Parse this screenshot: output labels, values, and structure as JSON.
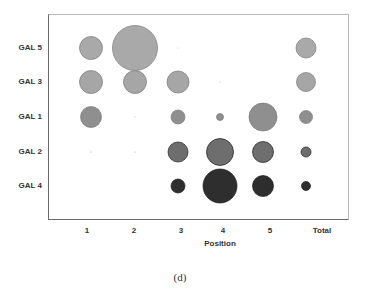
{
  "chart_data": {
    "type": "scatter",
    "subtype": "bubble",
    "title": "",
    "caption": "(d)",
    "xlabel": "Position",
    "ylabel": "",
    "categories_x": [
      "1",
      "2",
      "3",
      "4",
      "5",
      "Total"
    ],
    "categories_y": [
      "GAL 5",
      "GAL 3",
      "GAL 1",
      "GAL 2",
      "GAL 4"
    ],
    "grid": false,
    "legend": null,
    "series": [
      {
        "name": "GAL 5",
        "color": "#a9a9a9",
        "sizes": [
          23,
          45,
          1,
          0,
          0,
          20
        ]
      },
      {
        "name": "GAL 3",
        "color": "#a6a6a6",
        "sizes": [
          23,
          23,
          22,
          1,
          0,
          19
        ]
      },
      {
        "name": "GAL 1",
        "color": "#8f8f8f",
        "sizes": [
          21,
          1,
          14,
          7,
          28,
          13
        ]
      },
      {
        "name": "GAL 2",
        "color": "#6e6e6e",
        "sizes": [
          1,
          1,
          20,
          27,
          21,
          10
        ]
      },
      {
        "name": "GAL 4",
        "color": "#2e2e2e",
        "sizes": [
          0,
          0,
          14,
          34,
          21,
          9
        ]
      }
    ],
    "size_units": "bubble diameter in px (relative)"
  },
  "axes": {
    "x_ticks": [
      "1",
      "2",
      "3",
      "4",
      "5",
      "Total"
    ],
    "y_ticks": [
      "GAL 5",
      "GAL 3",
      "GAL 1",
      "GAL 2",
      "GAL 4"
    ],
    "x_title": "Position"
  },
  "figure": {
    "caption": "(d)"
  }
}
